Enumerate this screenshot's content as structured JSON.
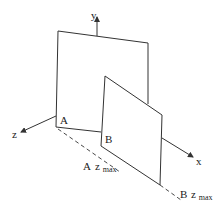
{
  "diagram": {
    "type": "3d-coordinate-planes",
    "axes": {
      "x": {
        "label": "x"
      },
      "y": {
        "label": "y"
      },
      "z": {
        "label": "z"
      }
    },
    "points": {
      "A": {
        "label": "A"
      },
      "B": {
        "label": "B"
      }
    },
    "annotations": {
      "a_zmax": {
        "base": "A",
        "var": "z",
        "sub": "max"
      },
      "b_zmax": {
        "base": "B",
        "var": "z",
        "sub": "max"
      }
    },
    "colors": {
      "stroke": "#333333",
      "background": "#ffffff"
    }
  }
}
